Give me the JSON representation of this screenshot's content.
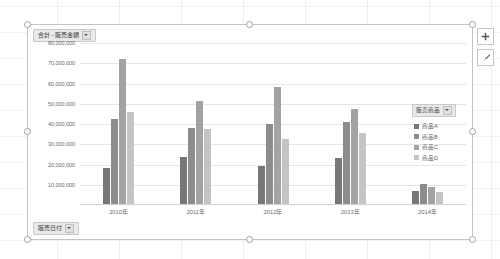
{
  "chart": {
    "title_field": "合計 - 販売金額",
    "title_field_arrow": "chevron-down-icon",
    "axis_field": "販売日付",
    "axis_field_arrow": "chevron-down-icon"
  },
  "legend": {
    "header": "販売商品",
    "header_arrow": "chevron-down-icon",
    "items": [
      {
        "label": "商品A",
        "color": "#777777"
      },
      {
        "label": "商品B",
        "color": "#8c8c8c"
      },
      {
        "label": "商品C",
        "color": "#a3a3a3"
      },
      {
        "label": "商品D",
        "color": "#c4c4c4"
      }
    ]
  },
  "side_buttons": [
    {
      "name": "chart-elements-button",
      "icon": "plus-icon"
    },
    {
      "name": "chart-styles-button",
      "icon": "brush-icon"
    }
  ],
  "chart_data": {
    "type": "bar",
    "title": "合計 - 販売金額",
    "xlabel": "販売日付",
    "ylabel": "",
    "categories": [
      "2010年",
      "2011年",
      "2012年",
      "2013年",
      "2014年"
    ],
    "series": [
      {
        "name": "商品A",
        "color": "#777777",
        "values": [
          18000000,
          23500000,
          19000000,
          23000000,
          6500000
        ]
      },
      {
        "name": "商品B",
        "color": "#8c8c8c",
        "values": [
          42000000,
          38000000,
          40000000,
          41000000,
          10000000
        ]
      },
      {
        "name": "商品C",
        "color": "#a3a3a3",
        "values": [
          72000000,
          51000000,
          58000000,
          47000000,
          8500000
        ]
      },
      {
        "name": "商品D",
        "color": "#c4c4c4",
        "values": [
          45500000,
          37500000,
          32500000,
          35500000,
          6000000
        ]
      }
    ],
    "ylim": [
      0,
      80000000
    ],
    "ytick_values": [
      10000000,
      20000000,
      30000000,
      40000000,
      50000000,
      60000000,
      70000000,
      80000000
    ],
    "ytick_labels": [
      "10,000,000",
      "20,000,000",
      "30,000,000",
      "40,000,000",
      "50,000,000",
      "60,000,000",
      "70,000,000",
      "80,000,000"
    ],
    "grid": true,
    "legend_position": "right"
  }
}
